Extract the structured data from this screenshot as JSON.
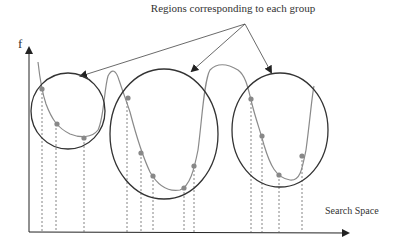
{
  "title": "Regions corresponding to each group",
  "y_axis_label": "f",
  "x_axis_label": "Search Space",
  "colors": {
    "axis": "#222222",
    "circle": "#333333",
    "curve": "#8a8a8a",
    "point": "#888888",
    "dashed": "#666666",
    "arrow": "#444444"
  },
  "groups": [
    {
      "name": "group-1",
      "sample_points": 3
    },
    {
      "name": "group-2",
      "sample_points": 5
    },
    {
      "name": "group-3",
      "sample_points": 4
    }
  ]
}
